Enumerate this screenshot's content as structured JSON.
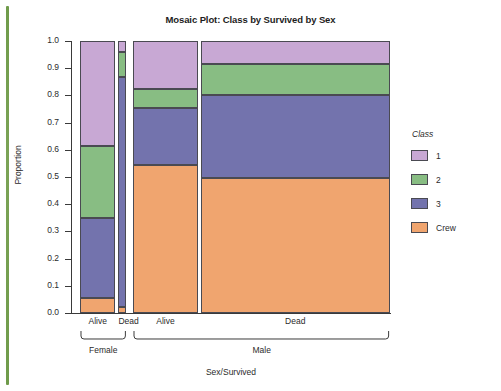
{
  "chart_data": {
    "type": "bar",
    "variant": "mosaic",
    "title": "Mosaic Plot: Class by Survived by Sex",
    "xlabel": "Sex/Survived",
    "ylabel": "Proportion",
    "ylim": [
      0.0,
      1.0
    ],
    "grid": false,
    "legend": {
      "position": "right",
      "title": "Class",
      "entries": [
        {
          "label": "1",
          "color": "#c8a8d4"
        },
        {
          "label": "2",
          "color": "#88bd83"
        },
        {
          "label": "3",
          "color": "#7373ad"
        },
        {
          "label": "Crew",
          "color": "#f0a56f"
        }
      ]
    },
    "ytick_labels": [
      "1.0",
      "0.9",
      "0.8",
      "0.7",
      "0.6",
      "0.5",
      "0.4",
      "0.3",
      "0.2",
      "0.1",
      "0.0"
    ],
    "ytick_values": [
      1.0,
      0.9,
      0.8,
      0.7,
      0.6,
      0.5,
      0.4,
      0.3,
      0.2,
      0.1,
      0.0
    ],
    "groups": [
      {
        "label": "Female",
        "width_fraction": 0.155
      },
      {
        "label": "Male",
        "width_fraction": 0.845
      }
    ],
    "columns": [
      {
        "group": "Female",
        "label": "Alive",
        "width_fraction": 0.116,
        "segments": [
          {
            "class": "Crew",
            "proportion": 0.054,
            "color": "#f0a56f"
          },
          {
            "class": "3",
            "proportion": 0.296,
            "color": "#7373ad"
          },
          {
            "class": "2",
            "proportion": 0.264,
            "color": "#88bd83"
          },
          {
            "class": "1",
            "proportion": 0.386,
            "color": "#c8a8d4"
          }
        ],
        "cumulative_tops": [
          0.054,
          0.35,
          0.614,
          1.0
        ]
      },
      {
        "group": "Female",
        "label": "Dead",
        "width_fraction": 0.026,
        "segments": [
          {
            "class": "Crew",
            "proportion": 0.021,
            "color": "#f0a56f"
          },
          {
            "class": "3",
            "proportion": 0.847,
            "color": "#7373ad"
          },
          {
            "class": "2",
            "proportion": 0.09,
            "color": "#88bd83"
          },
          {
            "class": "1",
            "proportion": 0.042,
            "color": "#c8a8d4"
          }
        ],
        "cumulative_tops": [
          0.021,
          0.868,
          0.958,
          1.0
        ]
      },
      {
        "group": "Male",
        "label": "Alive",
        "width_fraction": 0.21,
        "segments": [
          {
            "class": "Crew",
            "proportion": 0.545,
            "color": "#f0a56f"
          },
          {
            "class": "3",
            "proportion": 0.21,
            "color": "#7373ad"
          },
          {
            "class": "2",
            "proportion": 0.07,
            "color": "#88bd83"
          },
          {
            "class": "1",
            "proportion": 0.175,
            "color": "#c8a8d4"
          }
        ],
        "cumulative_tops": [
          0.545,
          0.755,
          0.825,
          1.0
        ]
      },
      {
        "group": "Male",
        "label": "Dead",
        "width_fraction": 0.62,
        "segments": [
          {
            "class": "Crew",
            "proportion": 0.497,
            "color": "#f0a56f"
          },
          {
            "class": "3",
            "proportion": 0.303,
            "color": "#7373ad"
          },
          {
            "class": "2",
            "proportion": 0.115,
            "color": "#88bd83"
          },
          {
            "class": "1",
            "proportion": 0.085,
            "color": "#c8a8d4"
          }
        ],
        "cumulative_tops": [
          0.497,
          0.8,
          0.915,
          1.0
        ]
      }
    ]
  },
  "decoration": {
    "page_rule_color": "#6f9b4a"
  }
}
